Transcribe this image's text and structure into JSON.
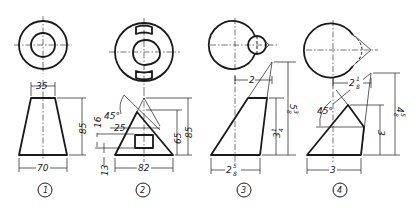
{
  "figures": [
    {
      "id": 1,
      "label": "1",
      "top_view": "concentric circles",
      "front_view": "truncated cone (trapezoid)",
      "dimensions": {
        "top_width": "35",
        "height": "85",
        "bottom_width": "70"
      }
    },
    {
      "id": 2,
      "label": "2",
      "top_view": "circle with egg-shaped inner cutout and two arc slots",
      "front_view": "cone with square hole and 45° cut",
      "dimensions": {
        "angle": "45°",
        "cut_height": "16",
        "hole_width": "25",
        "base_offset": "13",
        "inner_height": "65",
        "total_height": "85",
        "base_width": "82"
      }
    },
    {
      "id": 3,
      "label": "3",
      "top_view": "circle with tangent small circle forming teardrop",
      "front_view": "oblique truncated cone",
      "dimensions": {
        "top_offset": "2",
        "frustum_height_whole": "3",
        "frustum_height_frac_num": "1",
        "frustum_height_frac_den": "4",
        "total_height_whole": "5",
        "total_height_frac_num": "3",
        "total_height_frac_den": "8",
        "base_width_whole": "2",
        "base_width_frac_num": "5",
        "base_width_frac_den": "8"
      }
    },
    {
      "id": 4,
      "label": "4",
      "top_view": "circle with dashed tangent arc to apex point",
      "front_view": "oblique cone with 45° cut",
      "dimensions": {
        "apex_offset_whole": "2",
        "apex_offset_frac_num": "1",
        "apex_offset_frac_den": "8",
        "angle": "45°",
        "cut_height": "3",
        "total_height_whole": "4",
        "total_height_frac_num": "5",
        "total_height_frac_den": "8",
        "base_width": "3"
      }
    }
  ]
}
